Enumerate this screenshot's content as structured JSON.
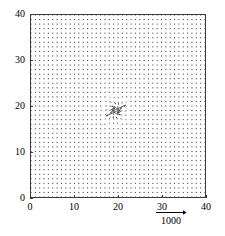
{
  "chart_data": {
    "type": "quiver",
    "title": "",
    "xlabel": "",
    "ylabel": "",
    "xlim": [
      0,
      40
    ],
    "ylim": [
      0,
      40
    ],
    "grid": false,
    "x_ticks": [
      0,
      10,
      20,
      30,
      40
    ],
    "y_ticks": [
      0,
      10,
      20,
      30,
      40
    ],
    "x_tick_labels": [
      "0",
      "10",
      "20",
      "30",
      "40"
    ],
    "y_tick_labels": [
      "0",
      "10",
      "20",
      "30",
      "40"
    ],
    "legend_position": "below-axis-right",
    "scale_reference": {
      "value": "1000",
      "arrow": "right-arrow",
      "description": "reference vector magnitude"
    },
    "field": {
      "grid_nx": 41,
      "grid_ny": 41,
      "grid_spacing": 1,
      "background_magnitude": 0.12,
      "singularity": {
        "type": "converging-sink",
        "center_x": 19.5,
        "center_y": 19.0,
        "strength": 9.0,
        "swirl": 0.45,
        "radius_of_influence": 7.0
      }
    },
    "marker_color": "#4a4a4a",
    "frame_color": "#3a3a3a"
  },
  "axes": {
    "y_labels": [
      {
        "text": "40",
        "value": 40
      },
      {
        "text": "30",
        "value": 30
      },
      {
        "text": "20",
        "value": 20
      },
      {
        "text": "10",
        "value": 10
      },
      {
        "text": "0",
        "value": 0
      }
    ],
    "x_labels": [
      {
        "text": "0",
        "value": 0
      },
      {
        "text": "10",
        "value": 10
      },
      {
        "text": "20",
        "value": 20
      },
      {
        "text": "30",
        "value": 30
      },
      {
        "text": "40",
        "value": 40
      }
    ]
  },
  "legend": {
    "scale_text": "1000"
  }
}
